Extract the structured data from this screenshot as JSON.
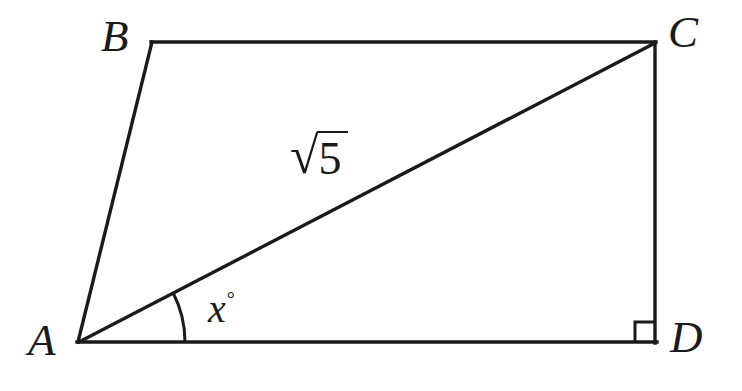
{
  "figure": {
    "background_color": "#ffffff",
    "stroke_color": "#1a1a1a",
    "stroke_width": 3,
    "width": 742,
    "height": 391,
    "vertices": {
      "A": {
        "label": "A",
        "x": 78,
        "y": 342
      },
      "B": {
        "label": "B",
        "x": 152,
        "y": 42
      },
      "C": {
        "label": "C",
        "x": 655,
        "y": 42
      },
      "D": {
        "label": "D",
        "x": 655,
        "y": 342
      }
    },
    "edges": [
      {
        "name": "side-AB",
        "from": "A",
        "to": "B"
      },
      {
        "name": "side-BC",
        "from": "B",
        "to": "C"
      },
      {
        "name": "side-CD",
        "from": "C",
        "to": "D"
      },
      {
        "name": "side-DA",
        "from": "D",
        "to": "A"
      }
    ],
    "diagonal": {
      "name": "diagonal-AC",
      "from": "A",
      "to": "C",
      "length_label_radical": "√",
      "length_label_radicand": "5",
      "length_label_text": "√5"
    },
    "angle_marker": {
      "name": "angle-at-A",
      "at_vertex": "A",
      "between": [
        "diagonal-AC",
        "side-DA"
      ],
      "label_variable": "x",
      "label_degree_symbol": "°",
      "label_text": "x°",
      "arc_radius": 107
    },
    "right_angle_marker": {
      "name": "right-angle-at-D",
      "at_vertex": "D",
      "size": 20,
      "measure": "90°"
    }
  }
}
